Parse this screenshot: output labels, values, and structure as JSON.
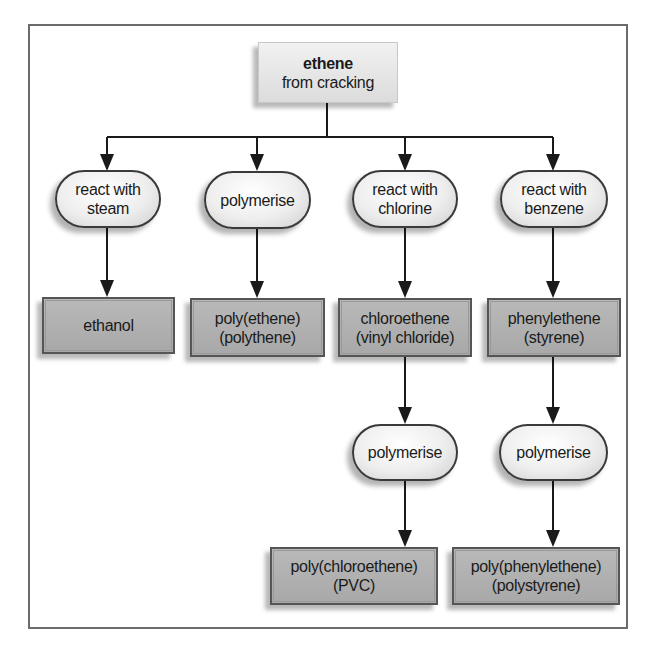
{
  "diagram": {
    "source": {
      "title": "ethene",
      "subtitle": "from cracking"
    },
    "branches": [
      {
        "process": [
          "react with",
          "steam"
        ],
        "product": [
          "ethanol"
        ]
      },
      {
        "process": [
          "polymerise"
        ],
        "product": [
          "poly(ethene)",
          "(polythene)"
        ]
      },
      {
        "process": [
          "react with",
          "chlorine"
        ],
        "product": [
          "chloroethene",
          "(vinyl chloride)"
        ],
        "next_process": [
          "polymerise"
        ],
        "final_product": [
          "poly(chloroethene)",
          "(PVC)"
        ]
      },
      {
        "process": [
          "react with",
          "benzene"
        ],
        "product": [
          "phenylethene",
          "(styrene)"
        ],
        "next_process": [
          "polymerise"
        ],
        "final_product": [
          "poly(phenylethene)",
          "(polystyrene)"
        ]
      }
    ]
  },
  "colors": {
    "frame": "#6b6b6b",
    "line": "#1a1a1a",
    "process_fill": "#eeeeee",
    "product_fill": "#b0b0b0",
    "source_fill": "#e6e6e6"
  }
}
